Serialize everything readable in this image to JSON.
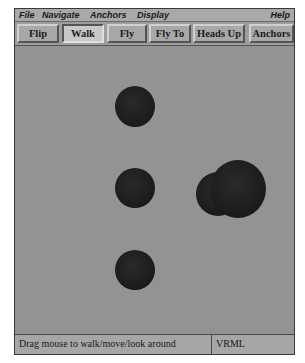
{
  "menubar": {
    "items": [
      {
        "label": "File"
      },
      {
        "label": "Navigate"
      },
      {
        "label": "Anchors"
      },
      {
        "label": "Display"
      }
    ],
    "help_label": "Help"
  },
  "toolbar": {
    "buttons": [
      {
        "label": "Flip",
        "active": false
      },
      {
        "label": "Walk",
        "active": true
      },
      {
        "label": "Fly",
        "active": false
      },
      {
        "label": "Fly To",
        "active": false
      },
      {
        "label": "Heads Up",
        "active": false
      },
      {
        "label": "Anchors",
        "active": false
      }
    ]
  },
  "viewport": {
    "background_color": "#939393",
    "objects": [
      {
        "type": "sphere",
        "label": "sphere-top"
      },
      {
        "type": "sphere",
        "label": "sphere-middle"
      },
      {
        "type": "sphere",
        "label": "sphere-bottom"
      },
      {
        "type": "sphere-cluster",
        "label": "sphere-right"
      }
    ]
  },
  "statusbar": {
    "message": "Drag mouse to walk/move/look around",
    "mode": "VRML"
  }
}
